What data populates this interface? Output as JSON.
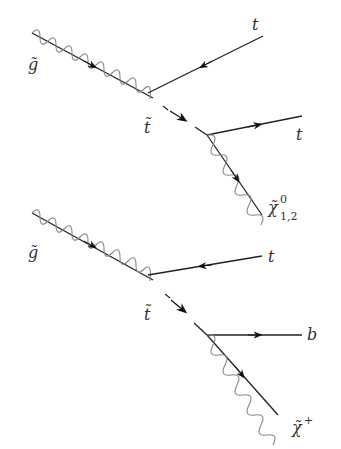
{
  "diagrams": [
    {
      "name": "gluino decay to top and stop, stop to top and neutralino",
      "labels": {
        "gluino": "g̃",
        "top_in": "t",
        "stop": "t̃",
        "top_out": "t",
        "neutralino": "χ̃",
        "neutralino_sup": "0",
        "neutralino_sub": "1,2"
      }
    },
    {
      "name": "gluino decay to top and stop, stop to bottom and chargino",
      "labels": {
        "gluino": "g̃",
        "top_in": "t",
        "stop": "t̃",
        "bottom_out": "b",
        "chargino": "χ̃",
        "chargino_sup": "+"
      }
    }
  ],
  "colors": {
    "line": "#222222",
    "wave": "#777777"
  }
}
